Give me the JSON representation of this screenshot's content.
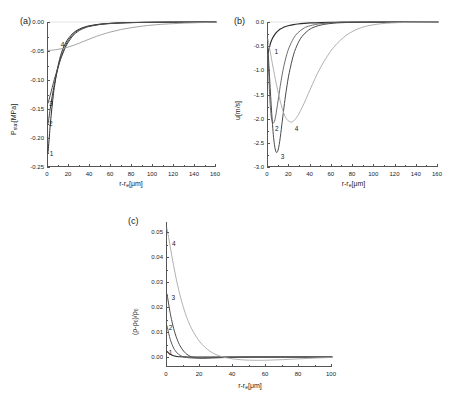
{
  "figure": {
    "caption_panels": [
      "(a)",
      "(b)",
      "(c)"
    ],
    "background": "#ffffff",
    "axis_color": "#555555"
  },
  "chart_data": [
    {
      "panel": "(a)",
      "type": "line",
      "title": "",
      "xlabel": "r-rₑ[μm]",
      "xlabel_base": "r-r",
      "xlabel_sub": "e",
      "xlabel_unit": "[μm]",
      "ylabel": "Pₛₜₐₜ[MPa]",
      "ylabel_base": "P",
      "ylabel_sub": "stat",
      "ylabel_unit": "[MPa]",
      "xlim": [
        0,
        160
      ],
      "ylim": [
        -0.25,
        0.0
      ],
      "xticks": [
        0,
        20,
        40,
        60,
        80,
        100,
        120,
        140,
        160
      ],
      "yticks": [
        0.0,
        -0.05,
        -0.1,
        -0.15,
        -0.2,
        -0.25
      ],
      "ytick_labels": [
        "0.00",
        "-0.05",
        "-0.10",
        "-0.15",
        "-0.20",
        "-0.25"
      ],
      "grid": false,
      "legend": "inline-curve-numbers",
      "series": [
        {
          "name": "1",
          "color": "#2b2b2b",
          "width": 1.0,
          "label_x": 2.5,
          "label_y": -0.228,
          "x": [
            0,
            0.5,
            1,
            1.5,
            2,
            3,
            4,
            5,
            6,
            8,
            10,
            12,
            14,
            16,
            18,
            20,
            24,
            28,
            32,
            36,
            40,
            50,
            60,
            70,
            80,
            95,
            110,
            130,
            160
          ],
          "y": [
            -0.225,
            -0.215,
            -0.203,
            -0.192,
            -0.181,
            -0.161,
            -0.143,
            -0.127,
            -0.113,
            -0.09,
            -0.072,
            -0.058,
            -0.047,
            -0.039,
            -0.032,
            -0.027,
            -0.019,
            -0.014,
            -0.0105,
            -0.008,
            -0.0063,
            -0.0036,
            -0.0022,
            -0.0014,
            -0.0009,
            -0.0005,
            -0.0003,
            -0.00015,
            -5e-05
          ]
        },
        {
          "name": "2",
          "color": "#3a3a3a",
          "width": 1.0,
          "label_x": 2.0,
          "label_y": -0.176,
          "x": [
            0,
            0.5,
            1,
            2,
            3,
            4,
            5,
            6,
            8,
            10,
            12,
            14,
            16,
            18,
            20,
            24,
            28,
            32,
            36,
            40,
            50,
            60,
            70,
            80,
            95,
            110,
            130,
            160
          ],
          "y": [
            -0.175,
            -0.17,
            -0.164,
            -0.151,
            -0.139,
            -0.128,
            -0.118,
            -0.108,
            -0.091,
            -0.076,
            -0.063,
            -0.053,
            -0.044,
            -0.036,
            -0.03,
            -0.021,
            -0.015,
            -0.0115,
            -0.0088,
            -0.0069,
            -0.0039,
            -0.0024,
            -0.0015,
            -0.001,
            -0.00055,
            -0.00032,
            -0.00016,
            -6e-05
          ]
        },
        {
          "name": "3",
          "color": "#4a4a4a",
          "width": 1.0,
          "label_x": 2.0,
          "label_y": -0.142,
          "x": [
            0,
            1,
            2,
            3,
            4,
            5,
            6,
            8,
            10,
            12,
            14,
            16,
            18,
            20,
            24,
            28,
            32,
            36,
            40,
            50,
            60,
            70,
            80,
            95,
            110,
            130,
            160
          ],
          "y": [
            -0.14,
            -0.134,
            -0.127,
            -0.12,
            -0.113,
            -0.106,
            -0.099,
            -0.087,
            -0.075,
            -0.064,
            -0.055,
            -0.046,
            -0.039,
            -0.033,
            -0.023,
            -0.017,
            -0.0125,
            -0.0095,
            -0.0074,
            -0.0042,
            -0.0026,
            -0.0016,
            -0.0011,
            -0.0006,
            -0.00034,
            -0.00017,
            -6e-05
          ]
        },
        {
          "name": "4",
          "color": "#9a9a9a",
          "width": 0.9,
          "label_x": 13,
          "label_y": -0.04,
          "x": [
            0,
            2,
            5,
            10,
            15,
            20,
            25,
            30,
            35,
            40,
            45,
            50,
            60,
            70,
            80,
            90,
            100,
            115,
            130,
            145,
            160
          ],
          "y": [
            -0.049,
            -0.0488,
            -0.0483,
            -0.047,
            -0.0452,
            -0.0428,
            -0.0398,
            -0.0363,
            -0.0326,
            -0.029,
            -0.0255,
            -0.0224,
            -0.017,
            -0.0128,
            -0.0096,
            -0.0071,
            -0.0052,
            -0.0032,
            -0.0019,
            -0.001,
            -0.0004
          ]
        }
      ]
    },
    {
      "panel": "(b)",
      "type": "line",
      "title": "",
      "xlabel": "r-rₑ[μm]",
      "xlabel_base": "r-r",
      "xlabel_sub": "e",
      "xlabel_unit": "[μm]",
      "ylabel": "u[m/s]",
      "ylabel_base": "u[m/s]",
      "ylabel_sub": "",
      "ylabel_unit": "",
      "xlim": [
        0,
        160
      ],
      "ylim": [
        -3.0,
        0.0
      ],
      "xticks": [
        0,
        20,
        40,
        60,
        80,
        100,
        120,
        140,
        160
      ],
      "yticks": [
        0.0,
        -0.5,
        -1.0,
        -1.5,
        -2.0,
        -2.5,
        -3.0
      ],
      "ytick_labels": [
        "0.0",
        "-0.5",
        "-1.0",
        "-1.5",
        "-2.0",
        "-2.5",
        "-3.0"
      ],
      "grid": false,
      "legend": "inline-curve-numbers",
      "series": [
        {
          "name": "1",
          "color": "#2b2b2b",
          "width": 1.2,
          "label_x": 7,
          "label_y": -0.62,
          "x": [
            0,
            0.5,
            1,
            2,
            3,
            4,
            5,
            6,
            8,
            10,
            12,
            14,
            16,
            20,
            24,
            28,
            34,
            40,
            50,
            60,
            70,
            85,
            100,
            120,
            140,
            160
          ],
          "y": [
            -0.65,
            -0.6,
            -0.55,
            -0.465,
            -0.4,
            -0.348,
            -0.305,
            -0.27,
            -0.214,
            -0.173,
            -0.142,
            -0.118,
            -0.099,
            -0.072,
            -0.054,
            -0.041,
            -0.028,
            -0.02,
            -0.0115,
            -0.007,
            -0.0045,
            -0.0025,
            -0.0015,
            -0.0007,
            -0.0003,
            -0.0001
          ]
        },
        {
          "name": "2",
          "color": "#6e6e6e",
          "width": 1.0,
          "label_x": 7.5,
          "label_y": -2.22,
          "x": [
            0,
            0.5,
            1,
            1.5,
            2,
            3,
            4,
            5,
            6,
            7,
            8,
            9,
            10,
            11,
            12,
            14,
            16,
            18,
            20,
            24,
            28,
            34,
            40,
            50,
            60,
            70,
            85,
            100,
            120,
            140,
            160
          ],
          "y": [
            -0.62,
            -0.95,
            -1.25,
            -1.5,
            -1.7,
            -1.95,
            -2.06,
            -2.09,
            -2.06,
            -1.97,
            -1.84,
            -1.7,
            -1.55,
            -1.4,
            -1.26,
            -1.01,
            -0.81,
            -0.65,
            -0.52,
            -0.34,
            -0.225,
            -0.125,
            -0.075,
            -0.033,
            -0.016,
            -0.008,
            -0.003,
            -0.0015,
            -0.0006,
            -0.0002,
            -0.0001
          ]
        },
        {
          "name": "3",
          "color": "#4a4a4a",
          "width": 1.0,
          "label_x": 13,
          "label_y": -2.8,
          "x": [
            0,
            1,
            2,
            3,
            4,
            5,
            6,
            7,
            8,
            9,
            10,
            11,
            12,
            13,
            14,
            16,
            18,
            20,
            24,
            28,
            32,
            38,
            44,
            52,
            62,
            72,
            85,
            100,
            120,
            140,
            160
          ],
          "y": [
            -0.55,
            -0.95,
            -1.35,
            -1.72,
            -2.05,
            -2.33,
            -2.53,
            -2.65,
            -2.7,
            -2.68,
            -2.6,
            -2.47,
            -2.31,
            -2.13,
            -1.95,
            -1.6,
            -1.3,
            -1.05,
            -0.68,
            -0.45,
            -0.3,
            -0.17,
            -0.1,
            -0.052,
            -0.024,
            -0.012,
            -0.005,
            -0.002,
            -0.0008,
            -0.0003,
            -0.0001
          ]
        },
        {
          "name": "4",
          "color": "#a8a8a8",
          "width": 0.9,
          "label_x": 26,
          "label_y": -2.22,
          "x": [
            0,
            2,
            4,
            6,
            8,
            10,
            12,
            14,
            16,
            18,
            20,
            22,
            24,
            26,
            28,
            30,
            34,
            38,
            42,
            46,
            50,
            56,
            62,
            68,
            74,
            80,
            88,
            96,
            106,
            118,
            132,
            146,
            160
          ],
          "y": [
            -0.35,
            -0.6,
            -0.85,
            -1.08,
            -1.3,
            -1.5,
            -1.68,
            -1.83,
            -1.95,
            -2.02,
            -2.06,
            -2.07,
            -2.05,
            -2.0,
            -1.94,
            -1.86,
            -1.68,
            -1.48,
            -1.28,
            -1.09,
            -0.92,
            -0.7,
            -0.52,
            -0.38,
            -0.27,
            -0.19,
            -0.115,
            -0.07,
            -0.037,
            -0.017,
            -0.007,
            -0.003,
            -0.001
          ]
        }
      ]
    },
    {
      "panel": "(c)",
      "type": "line",
      "title": "",
      "xlabel": "r-rₑ[μm]",
      "xlabel_base": "r-r",
      "xlabel_sub": "e",
      "xlabel_unit": "[μm]",
      "ylabel": "(ρ-ρ₀)/ρ₀",
      "ylabel_base": "(ρ-ρ",
      "ylabel_sub": "0",
      "ylabel_unit": ")/ρ",
      "ylabel_sub2": "0",
      "xlim": [
        0,
        100
      ],
      "ylim": [
        -0.004,
        0.054
      ],
      "xticks": [
        0,
        20,
        40,
        60,
        80,
        100
      ],
      "yticks": [
        0.0,
        0.01,
        0.02,
        0.03,
        0.04,
        0.05
      ],
      "ytick_labels": [
        "0.00",
        "0.01",
        "0.02",
        "0.03",
        "0.04",
        "0.05"
      ],
      "grid": false,
      "legend": "inline-curve-numbers",
      "series": [
        {
          "name": "1",
          "color": "#2b2b2b",
          "width": 1.1,
          "label_x": 1.6,
          "label_y": 0.0016,
          "x": [
            0,
            0.5,
            1,
            1.5,
            2,
            3,
            4,
            5,
            6,
            8,
            10,
            13,
            16,
            20,
            26,
            34,
            44,
            56,
            70,
            85,
            100
          ],
          "y": [
            0.0022,
            0.0019,
            0.0016,
            0.0013,
            0.0011,
            0.00075,
            0.0005,
            0.00035,
            0.00022,
            0.0001,
            4e-05,
            1e-05,
            0,
            0,
            0,
            0,
            0,
            0,
            0,
            0,
            0
          ]
        },
        {
          "name": "2",
          "color": "#5a5a5a",
          "width": 1.0,
          "label_x": 1.7,
          "label_y": 0.0118,
          "x": [
            0,
            0.5,
            1,
            1.5,
            2,
            2.5,
            3,
            4,
            5,
            6,
            7,
            8,
            9,
            10,
            12,
            14,
            16,
            18,
            20,
            24,
            28,
            34,
            42,
            52,
            64,
            78,
            90,
            100
          ],
          "y": [
            0.0125,
            0.011,
            0.0095,
            0.0082,
            0.007,
            0.006,
            0.0051,
            0.0036,
            0.0025,
            0.0017,
            0.0011,
            0.00065,
            0.0003,
            8e-05,
            -0.0002,
            -0.00035,
            -0.00042,
            -0.00042,
            -0.00038,
            -0.00028,
            -0.00018,
            -9e-05,
            -3e-05,
            0,
            0,
            0,
            0,
            0
          ]
        },
        {
          "name": "3",
          "color": "#4a4a4a",
          "width": 1.0,
          "label_x": 3.4,
          "label_y": 0.0235,
          "x": [
            0,
            0.5,
            1,
            1.5,
            2,
            3,
            4,
            5,
            6,
            7,
            8,
            9,
            10,
            11,
            12,
            14,
            16,
            18,
            20,
            23,
            26,
            30,
            35,
            42,
            50,
            60,
            72,
            85,
            100
          ],
          "y": [
            0.0252,
            0.0232,
            0.0212,
            0.0192,
            0.0174,
            0.0142,
            0.0115,
            0.0092,
            0.0073,
            0.0057,
            0.0044,
            0.0033,
            0.0024,
            0.0017,
            0.0011,
            0.0003,
            -0.00015,
            -0.00038,
            -0.00048,
            -0.0005,
            -0.00044,
            -0.00034,
            -0.00022,
            -0.00011,
            -5e-05,
            -2e-05,
            0,
            0,
            0
          ]
        },
        {
          "name": "4",
          "color": "#a8a8a8",
          "width": 0.9,
          "label_x": 3.6,
          "label_y": 0.0452,
          "x": [
            0,
            1,
            2,
            3,
            4,
            5,
            6,
            7,
            8,
            10,
            12,
            14,
            16,
            18,
            20,
            23,
            26,
            29,
            32,
            36,
            40,
            45,
            50,
            56,
            62,
            70,
            78,
            86,
            94,
            100
          ],
          "y": [
            0.0515,
            0.0478,
            0.044,
            0.0402,
            0.0366,
            0.0332,
            0.03,
            0.0271,
            0.0244,
            0.0197,
            0.0158,
            0.0126,
            0.01,
            0.0078,
            0.006,
            0.0039,
            0.0023,
            0.0012,
            0.0004,
            -0.0003,
            -0.00075,
            -0.0011,
            -0.00128,
            -0.00132,
            -0.00125,
            -0.00105,
            -0.0008,
            -0.00055,
            -0.00032,
            -0.00018
          ]
        }
      ]
    }
  ]
}
